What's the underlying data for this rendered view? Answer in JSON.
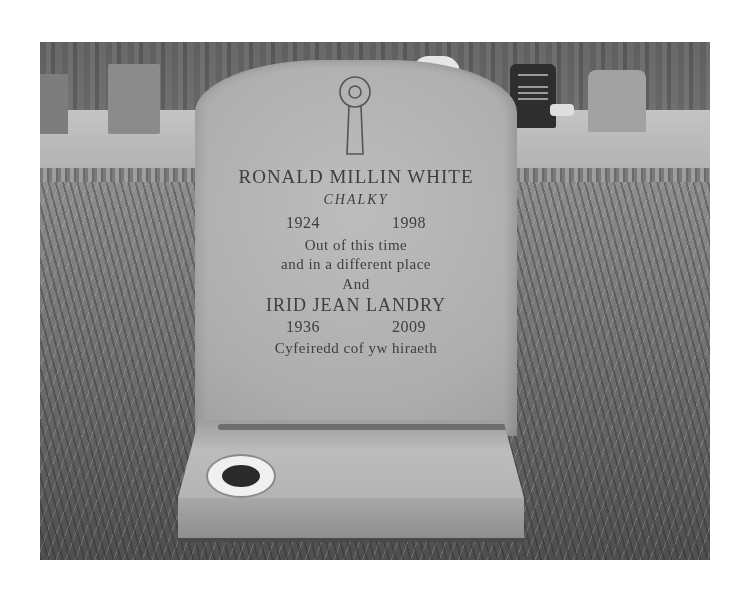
{
  "photo": {
    "subject": "headstone",
    "description": "Black-and-white photo of a granite headstone in a grassy cemetery, with other gravestones in the background"
  },
  "headstone": {
    "emblem": "keyhole-shaped ring cross",
    "inscription": {
      "name_1": "RONALD MILLIN WHITE",
      "nickname_1": "CHALKY",
      "birth_year_1": "1924",
      "death_year_1": "1998",
      "verse_line_1": "Out of this time",
      "verse_line_2": "and in a different place",
      "conjunction": "And",
      "name_2": "IRID JEAN LANDRY",
      "birth_year_2": "1936",
      "death_year_2": "2009",
      "welsh_line": "Cyfeiredd cof yw hiraeth"
    }
  },
  "base": {
    "features": [
      "flower vase hole"
    ]
  },
  "colors": {
    "page_background": "#ffffff",
    "stone": "#b0b0b0",
    "lettering": "#3e3e3e",
    "grass_dark": "#4e4e4e"
  }
}
